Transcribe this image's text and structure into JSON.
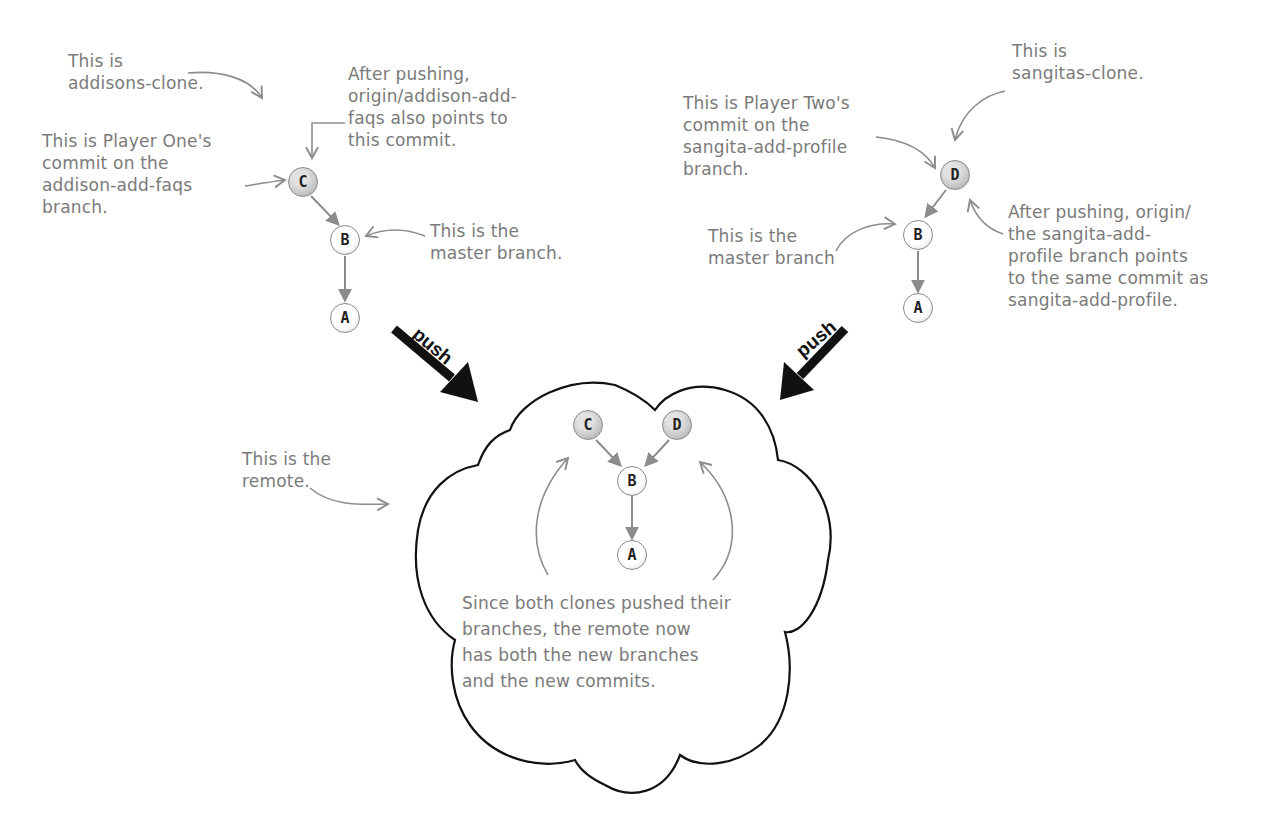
{
  "colors": {
    "annotation_text": "#7a7a7a",
    "annotation_arrow": "#8c8c8c",
    "node_fill_new": "#c8c8c8",
    "node_fill_old": "#ffffff",
    "push_arrow": "#111111",
    "cloud_outline": "#111111"
  },
  "addisons_clone": {
    "label": "This is\naddisons-clone.",
    "commit_note": "This is Player One's\ncommit on the\naddison-add-faqs\nbranch.",
    "push_note": "After pushing,\norigin/addison-add-\nfaqs also points to\nthis commit.",
    "master_note": "This is the\nmaster branch.",
    "nodes": [
      {
        "id": "C",
        "style": "gray"
      },
      {
        "id": "B",
        "style": "white"
      },
      {
        "id": "A",
        "style": "white"
      }
    ]
  },
  "sangitas_clone": {
    "label": "This is\nsangitas-clone.",
    "commit_note": "This is Player Two's\ncommit on the\nsangita-add-profile\nbranch.",
    "master_note": "This is the\nmaster branch",
    "push_note": "After pushing, origin/\nthe sangita-add-\nprofile branch points\nto the same commit as\nsangita-add-profile.",
    "nodes": [
      {
        "id": "D",
        "style": "gray"
      },
      {
        "id": "B",
        "style": "white"
      },
      {
        "id": "A",
        "style": "white"
      }
    ]
  },
  "push_arrows": {
    "left_label": "push",
    "right_label": "push"
  },
  "remote": {
    "label": "This is the\nremote.",
    "summary": "Since both clones pushed their\nbranches, the remote now\nhas both the new branches\nand the new commits.",
    "nodes": [
      {
        "id": "C",
        "style": "gray"
      },
      {
        "id": "D",
        "style": "gray"
      },
      {
        "id": "B",
        "style": "white"
      },
      {
        "id": "A",
        "style": "white"
      }
    ]
  }
}
